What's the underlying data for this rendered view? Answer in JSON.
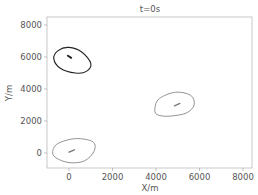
{
  "chart_data": {
    "type": "line",
    "title": "t=0s",
    "xlabel": "X/m",
    "ylabel": "Y/m",
    "xlim": [
      -1000,
      8400
    ],
    "ylim": [
      -1000,
      8500
    ],
    "xticks": [
      0,
      2000,
      4000,
      6000,
      8000
    ],
    "yticks": [
      0,
      2000,
      4000,
      6000,
      8000
    ],
    "xtick_labels": [
      "0",
      "2000",
      "4000",
      "6000",
      "8000"
    ],
    "ytick_labels": [
      "0",
      "2000",
      "4000",
      "6000",
      "8000"
    ],
    "grid": false,
    "legend": null,
    "series": [
      {
        "name": "contour-1",
        "color": "#222222",
        "center": [
          0,
          6000
        ],
        "outline": [
          [
            -700,
            5900
          ],
          [
            -500,
            6400
          ],
          [
            0,
            6600
          ],
          [
            600,
            6300
          ],
          [
            1000,
            5600
          ],
          [
            800,
            5100
          ],
          [
            300,
            5000
          ],
          [
            -400,
            5300
          ],
          [
            -700,
            5900
          ]
        ],
        "core": [
          [
            -50,
            6080
          ],
          [
            100,
            5950
          ]
        ]
      },
      {
        "name": "contour-2",
        "color": "#777777",
        "center": [
          5000,
          3000
        ],
        "outline": [
          [
            3950,
            2800
          ],
          [
            4150,
            3400
          ],
          [
            4900,
            3800
          ],
          [
            5600,
            3600
          ],
          [
            5750,
            3000
          ],
          [
            5400,
            2500
          ],
          [
            4600,
            2300
          ],
          [
            4050,
            2400
          ],
          [
            3950,
            2800
          ]
        ],
        "core": [
          [
            4850,
            2950
          ],
          [
            5100,
            3100
          ]
        ]
      },
      {
        "name": "contour-3",
        "color": "#777777",
        "center": [
          100,
          100
        ],
        "outline": [
          [
            -750,
            100
          ],
          [
            -500,
            600
          ],
          [
            300,
            900
          ],
          [
            1100,
            700
          ],
          [
            1150,
            100
          ],
          [
            700,
            -500
          ],
          [
            0,
            -600
          ],
          [
            -600,
            -300
          ],
          [
            -750,
            100
          ]
        ],
        "core": [
          [
            0,
            50
          ],
          [
            250,
            200
          ]
        ]
      }
    ]
  }
}
